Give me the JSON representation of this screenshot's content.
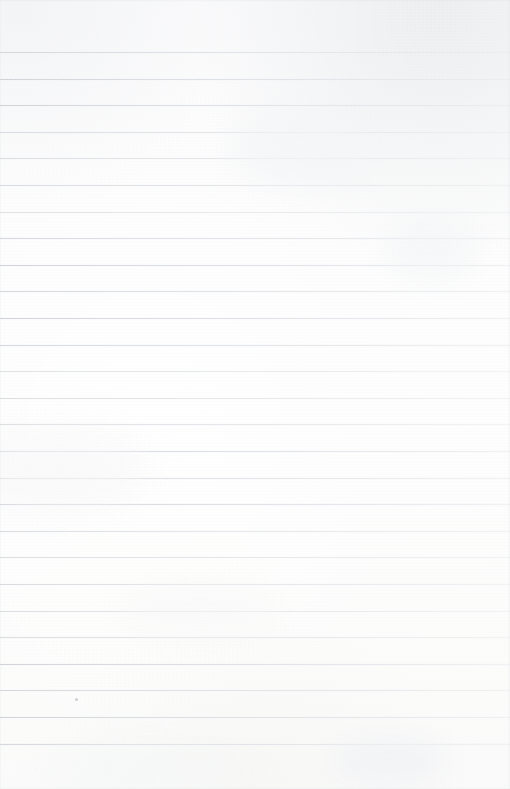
{
  "document": {
    "kind": "scanned-blank-ruled-paper",
    "page_label": "",
    "has_text_content": false,
    "notes_text": "",
    "width_px": 510,
    "height_px": 789
  },
  "paper": {
    "base_color": "#fdfdfd",
    "tint_top_right": "#dee1e4",
    "tint_top_left": "#e7e9ec",
    "tint_bottom": "#f6f6f4",
    "edge_shadow_color": "#d7dade"
  },
  "ruling": {
    "line_color": "#d4d8dd",
    "line_color_left": "#cbcfd4",
    "line_color_right": "#e6e9ed",
    "line_thickness_px": 1,
    "line_count": 27,
    "first_line_y": 52,
    "last_line_y": 744,
    "line_spacing_px": 26.6,
    "spans_full_width": true,
    "margin_rule_visible": false,
    "line_positions_y": [
      52,
      78.6,
      105.2,
      131.8,
      158.4,
      185,
      211.6,
      238.2,
      264.8,
      291.4,
      318,
      344.6,
      371.2,
      397.8,
      424.4,
      451,
      477.6,
      504.2,
      530.8,
      557.4,
      584,
      610.6,
      637.2,
      663.8,
      690.4,
      717,
      743.6
    ],
    "line_weights": [
      "ink-mid",
      "ink-strong",
      "ink-strong",
      "ink-faint",
      "ink-mid",
      "ink-strong",
      "ink-faint",
      "ink-mid",
      "ink-strong",
      "ink-mid",
      "ink-strong",
      "ink-mid",
      "ink-faint",
      "ink-mid",
      "ink-faint",
      "ink-strong",
      "ink-mid",
      "ink-strong",
      "ink-faint",
      "ink-mid",
      "ink-strong",
      "ink-mid",
      "ink-faint",
      "ink-strong",
      "ink-mid",
      "ink-strong",
      "ink-mid"
    ]
  },
  "artifacts": {
    "speck": {
      "x": 75,
      "y": 698,
      "color": "#cdd0d4"
    },
    "smudges": [
      {
        "x": 300,
        "y": 150,
        "w": 140,
        "h": 70,
        "color": "rgba(243,244,246,0.65)",
        "blur": 14
      },
      {
        "x": 60,
        "y": 470,
        "w": 170,
        "h": 80,
        "color": "rgba(246,247,248,0.60)",
        "blur": 16
      },
      {
        "x": 390,
        "y": 760,
        "w": 110,
        "h": 45,
        "color": "rgba(240,241,243,0.70)",
        "blur": 12
      },
      {
        "x": 150,
        "y": 770,
        "w": 200,
        "h": 40,
        "color": "rgba(244,245,246,0.55)",
        "blur": 15
      },
      {
        "x": 430,
        "y": 250,
        "w": 90,
        "h": 60,
        "color": "rgba(242,243,245,0.50)",
        "blur": 13
      },
      {
        "x": 200,
        "y": 610,
        "w": 160,
        "h": 55,
        "color": "rgba(247,247,248,0.50)",
        "blur": 14
      }
    ]
  }
}
